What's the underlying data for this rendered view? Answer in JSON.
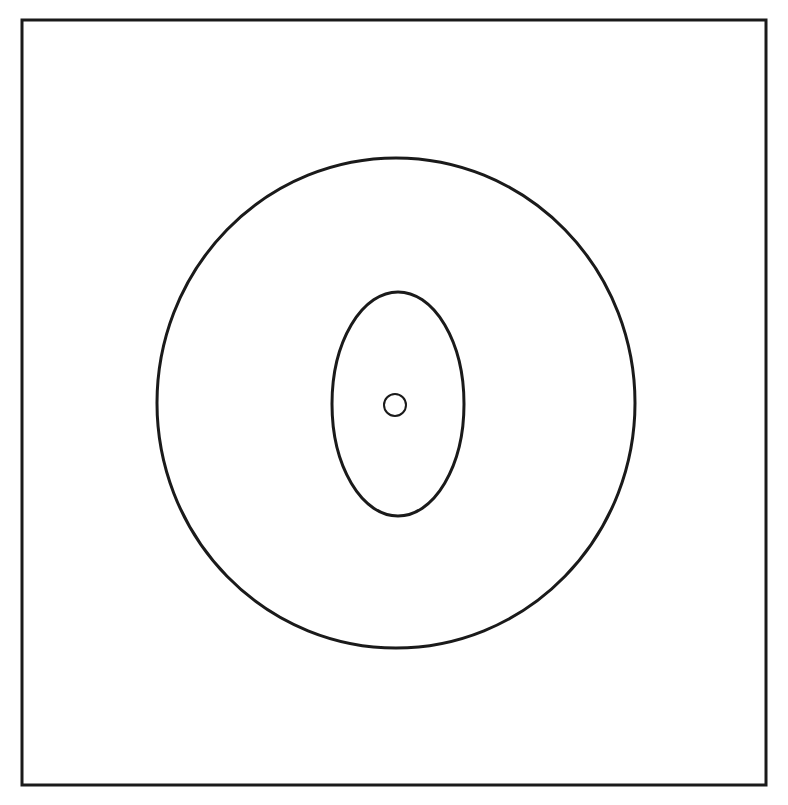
{
  "figure": {
    "top_caption": "",
    "bottom_caption": "",
    "frame": {
      "x": 22,
      "y": 20,
      "width": 744,
      "height": 765,
      "stroke": "#1a1a1a",
      "stroke_width": 3
    },
    "shapes": [
      {
        "name": "outer-circle",
        "cx": 396,
        "cy": 403,
        "rx": 239,
        "ry": 245,
        "stroke": "#1a1a1a",
        "stroke_width": 3
      },
      {
        "name": "middle-ellipse",
        "cx": 398,
        "cy": 404,
        "rx": 66,
        "ry": 112,
        "stroke": "#1a1a1a",
        "stroke_width": 3
      },
      {
        "name": "inner-circle",
        "cx": 395,
        "cy": 405,
        "rx": 11,
        "ry": 11,
        "stroke": "#1a1a1a",
        "stroke_width": 2
      }
    ]
  }
}
